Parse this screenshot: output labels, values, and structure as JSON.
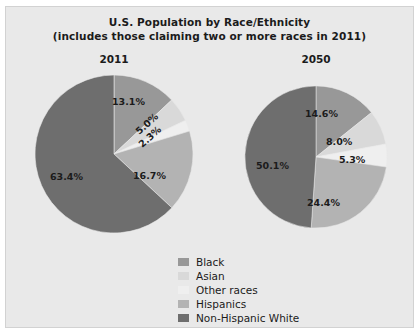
{
  "figure": {
    "title_line1": "U.S. Population by Race/Ethnicity",
    "title_line2": "(includes those claiming two or more races in 2011)",
    "background": "#e9e9e9",
    "border_color": "#d2d2d2"
  },
  "chart_data": {
    "type": "pie",
    "title": "U.S. Population by Race/Ethnicity (includes those claiming two or more races in 2011)",
    "xlabel": "",
    "ylabel": "",
    "grid": false,
    "legend_position": "bottom-center",
    "units": "percent",
    "categories": [
      "Black",
      "Asian",
      "Other races",
      "Hispanics",
      "Non-Hispanic White"
    ],
    "colors": [
      "#989898",
      "#d9d9d9",
      "#efefef",
      "#b3b3b3",
      "#6e6e6e"
    ],
    "charts": [
      {
        "name": "2011",
        "label": "2011",
        "values": [
          13.1,
          5.0,
          2.3,
          16.7,
          63.4
        ],
        "labels": [
          "13.1%",
          "5.0%",
          "2.3%",
          "16.7%",
          "63.4%"
        ]
      },
      {
        "name": "2050",
        "label": "2050",
        "values": [
          14.6,
          8.0,
          5.3,
          24.4,
          50.1
        ],
        "labels": [
          "14.6%",
          "8.0%",
          "5.3%",
          "24.4%",
          "50.1%"
        ]
      }
    ],
    "legend": [
      {
        "label": "Black",
        "color": "#989898"
      },
      {
        "label": "Asian",
        "color": "#d9d9d9"
      },
      {
        "label": "Other races",
        "color": "#efefef"
      },
      {
        "label": "Hispanics",
        "color": "#b3b3b3"
      },
      {
        "label": "Non-Hispanic White",
        "color": "#6e6e6e"
      }
    ]
  }
}
